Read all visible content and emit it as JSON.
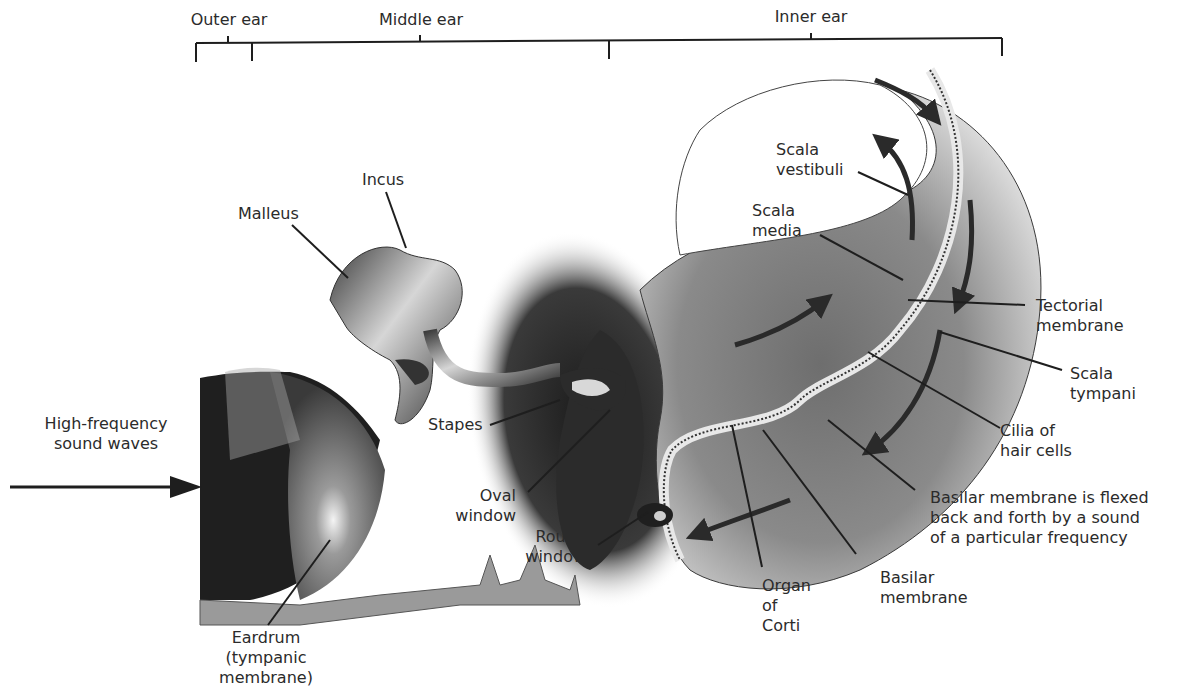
{
  "sections": {
    "outer_ear": "Outer ear",
    "middle_ear": "Middle ear",
    "inner_ear": "Inner ear"
  },
  "labels": {
    "incus": "Incus",
    "malleus": "Malleus",
    "stapes": "Stapes",
    "high_freq_1": "High-frequency",
    "high_freq_2": "sound waves",
    "oval_1": "Oval",
    "oval_2": "window",
    "round_1": "Round",
    "round_2": "window",
    "eardrum_1": "Eardrum",
    "eardrum_2": "(tympanic",
    "eardrum_3": "membrane)",
    "scala_vest_1": "Scala",
    "scala_vest_2": "vestibuli",
    "scala_media_1": "Scala",
    "scala_media_2": "media",
    "tectorial_1": "Tectorial",
    "tectorial_2": "membrane",
    "scala_tymp_1": "Scala",
    "scala_tymp_2": "tympani",
    "cilia_1": "Cilia of",
    "cilia_2": "hair cells",
    "flexed_1": "Basilar membrane is flexed",
    "flexed_2": "back and forth by a sound",
    "flexed_3": "of a particular frequency",
    "basilar_1": "Basilar",
    "basilar_2": "membrane",
    "corti_1": "Organ",
    "corti_2": "of",
    "corti_3": "Corti"
  },
  "colors": {
    "ink": "#1e1e1e",
    "dark": "#2a2a2a",
    "mid": "#7a7a7a",
    "light": "#c8c8c8",
    "tissue": "#9a9a9a"
  }
}
